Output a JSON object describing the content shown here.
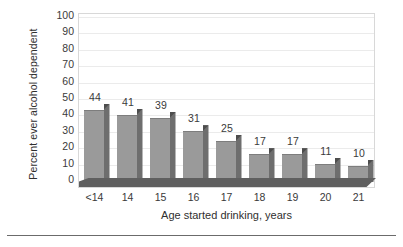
{
  "chart_data": {
    "type": "bar",
    "title": "",
    "subtitle": "",
    "xlabel": "Age started drinking, years",
    "ylabel": "Percent ever alcohol dependent",
    "categories": [
      "<14",
      "14",
      "15",
      "16",
      "17",
      "18",
      "19",
      "20",
      "21"
    ],
    "values": [
      44,
      41,
      39,
      31,
      25,
      17,
      17,
      11,
      10
    ],
    "value_labels": [
      "44",
      "41",
      "39",
      "31",
      "25",
      "17",
      "17",
      "11",
      "10"
    ],
    "ylim": [
      0,
      100
    ],
    "ytick_labels": [
      "0",
      "10",
      "20",
      "30",
      "40",
      "50",
      "60",
      "70",
      "80",
      "90",
      "100"
    ],
    "ytick_values": [
      0,
      10,
      20,
      30,
      40,
      50,
      60,
      70,
      80,
      90,
      100
    ],
    "grid": true,
    "grid_orientation": "horizontal",
    "legend": false,
    "legend_position": "none",
    "style": "3d-bars",
    "colors": {
      "bar_face": "#9a9a9a",
      "bar_side": "#6e6e6e",
      "bar_top": "#585858",
      "floor": "#5f5f5f",
      "gridline": "#ebebeb",
      "plot_border": "#d8d8d8",
      "text": "#3a3a3a",
      "background": "#ffffff",
      "rule": "#6b6b6b"
    }
  }
}
